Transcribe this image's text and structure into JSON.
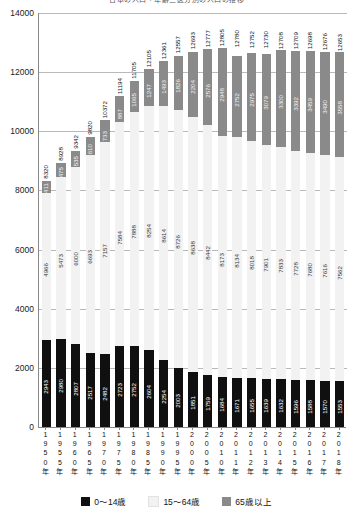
{
  "chart_data": {
    "type": "bar",
    "subtype": "stacked-vertical",
    "title": "日本の人口・年齢三区分別の人口の推移",
    "xlabel": "",
    "ylabel": "",
    "ylim": [
      0,
      14000
    ],
    "yticks": [
      0,
      2000,
      4000,
      6000,
      8000,
      10000,
      12000,
      14000
    ],
    "grid": true,
    "legend_position": "bottom",
    "categories": [
      "1950年",
      "1955年",
      "1960年",
      "1965年",
      "1970年",
      "1975年",
      "1980年",
      "1985年",
      "1990年",
      "1995年",
      "2000年",
      "2005年",
      "2010年",
      "2011年",
      "2012年",
      "2013年",
      "2014年",
      "2015年",
      "2016年",
      "2017年",
      "2018年"
    ],
    "series": [
      {
        "name": "0〜14歳",
        "color": "#101010",
        "values": [
          2943,
          2980,
          2807,
          2517,
          2482,
          2723,
          2752,
          2604,
          2254,
          2003,
          1851,
          1759,
          1684,
          1671,
          1655,
          1639,
          1632,
          1596,
          1588,
          1570,
          1553
        ]
      },
      {
        "name": "15〜64歳",
        "color": "#f2f2f2",
        "values": [
          4966,
          5473,
          6000,
          6693,
          7157,
          7584,
          7888,
          8254,
          8614,
          8726,
          8638,
          8442,
          8173,
          8134,
          8018,
          7901,
          7833,
          7728,
          7680,
          7616,
          7562
        ]
      },
      {
        "name": "65歳以上",
        "color": "#8a8a8a",
        "values": [
          411,
          475,
          535,
          610,
          733,
          887,
          1065,
          1247,
          1493,
          1826,
          2204,
          2576,
          2948,
          2752,
          2975,
          3079,
          3300,
          3392,
          3459,
          3490,
          3558
        ]
      }
    ],
    "totals": [
      8320,
      8928,
      9342,
      9820,
      10372,
      11194,
      11705,
      12105,
      12361,
      12557,
      12693,
      12777,
      12805,
      12780,
      12752,
      12730,
      12708,
      12709,
      12698,
      12676,
      12653
    ]
  },
  "legend": {
    "items": [
      {
        "label": "0〜14歳",
        "swatch": "legend-swatch-young"
      },
      {
        "label": "15〜64歳",
        "swatch": "legend-swatch-working"
      },
      {
        "label": "65歳以上",
        "swatch": "legend-swatch-elderly"
      }
    ]
  }
}
